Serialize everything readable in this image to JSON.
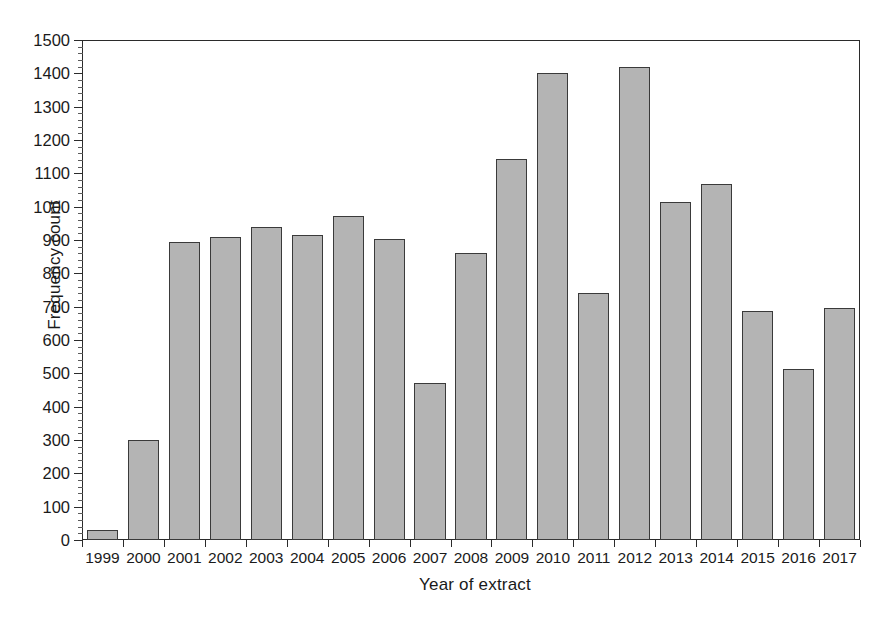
{
  "chart_data": {
    "type": "bar",
    "title": "",
    "xlabel": "Year of extract",
    "ylabel": "Frequency count",
    "categories": [
      "1999",
      "2000",
      "2001",
      "2002",
      "2003",
      "2004",
      "2005",
      "2006",
      "2007",
      "2008",
      "2009",
      "2010",
      "2011",
      "2012",
      "2013",
      "2014",
      "2015",
      "2016",
      "2017"
    ],
    "values": [
      30,
      300,
      894,
      910,
      940,
      916,
      972,
      902,
      472,
      860,
      1144,
      1402,
      740,
      1418,
      1014,
      1068,
      688,
      514,
      696
    ],
    "ylim": [
      0,
      1500
    ],
    "ytick_labels": [
      "0",
      "100",
      "200",
      "300",
      "400",
      "500",
      "600",
      "700",
      "800",
      "900",
      "1000",
      "1100",
      "1200",
      "1300",
      "1400",
      "1500"
    ],
    "ytick_step": 100,
    "yminor_step": 20,
    "grid": false,
    "legend": null,
    "bar_fill_color": "#b4b4b4",
    "bar_edge_color": "#3a3a3a",
    "axis_color": "#2b2b2b",
    "background_color": "#ffffff"
  }
}
